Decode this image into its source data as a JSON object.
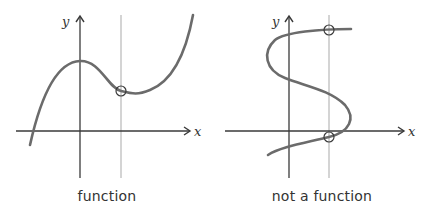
{
  "diagrams": [
    {
      "caption": "function",
      "x_axis_label": "x",
      "y_axis_label": "y",
      "intersections": 1
    },
    {
      "caption": "not a function",
      "x_axis_label": "x",
      "y_axis_label": "y",
      "intersections": 2
    }
  ],
  "colors": {
    "curve": "#6b6b6b",
    "axis": "#3a3a3a",
    "test_line": "#b8b8b8",
    "circle": "#3a3a3a",
    "text": "#333333"
  }
}
